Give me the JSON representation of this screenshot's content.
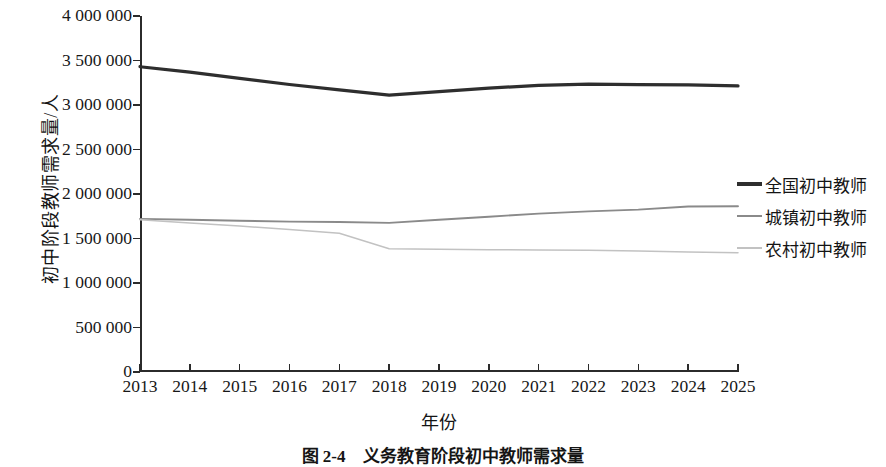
{
  "chart_data": {
    "type": "line",
    "title": "义务教育阶段初中教师需求量",
    "xlabel": "年份",
    "ylabel": "初中阶段教师需求量/人",
    "grid": false,
    "legend_position": "right",
    "categories": [
      "2013",
      "2014",
      "2015",
      "2016",
      "2017",
      "2018",
      "2019",
      "2020",
      "2021",
      "2022",
      "2023",
      "2024",
      "2025"
    ],
    "x": [
      2013,
      2014,
      2015,
      2016,
      2017,
      2018,
      2019,
      2020,
      2021,
      2022,
      2023,
      2024,
      2025
    ],
    "xlim": [
      2013,
      2025
    ],
    "ylim": [
      0,
      4000000
    ],
    "ytick_values": [
      4000000,
      3500000,
      3000000,
      2500000,
      2000000,
      1500000,
      1000000,
      500000,
      0
    ],
    "ytick_labels": [
      "4 000 000",
      "3 500 000",
      "3 000 000",
      "2 500 000",
      "2 000 000",
      "1 500 000",
      "1 000 000",
      "500 000",
      "0"
    ],
    "series": [
      {
        "name": "全国初中教师",
        "color": "#2e2e2e",
        "width": 3.2,
        "values": [
          3430000,
          3370000,
          3300000,
          3230000,
          3170000,
          3110000,
          3150000,
          3190000,
          3220000,
          3235000,
          3230000,
          3225000,
          3215000
        ]
      },
      {
        "name": "城镇初中教师",
        "color": "#8a8a8a",
        "width": 1.9,
        "values": [
          1720000,
          1710000,
          1700000,
          1690000,
          1685000,
          1675000,
          1710000,
          1745000,
          1780000,
          1805000,
          1825000,
          1860000,
          1862000
        ]
      },
      {
        "name": "农村初中教师",
        "color": "#c2c2c2",
        "width": 1.5,
        "values": [
          1710000,
          1675000,
          1640000,
          1600000,
          1560000,
          1385000,
          1380000,
          1375000,
          1372000,
          1368000,
          1360000,
          1348000,
          1340000
        ]
      }
    ]
  },
  "caption": {
    "number": "图 2-4",
    "text": "义务教育阶段初中教师需求量"
  }
}
